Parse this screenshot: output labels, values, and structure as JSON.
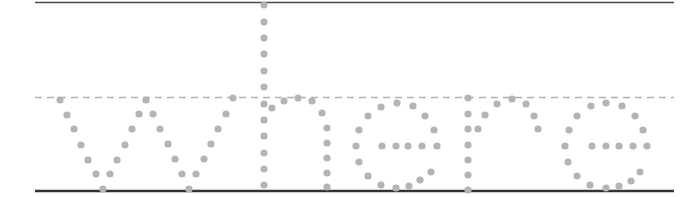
{
  "worksheet": {
    "word": "where",
    "letters": [
      "w",
      "h",
      "e",
      "r",
      "e"
    ],
    "style": "dotted tracing letters",
    "colors": {
      "dots": "#b4b4b4",
      "top_line": "#4a4a4a",
      "mid_line": "#b0b0b0",
      "base_line": "#333333",
      "background": "#ffffff"
    },
    "guides": {
      "x_start": 35,
      "x_end": 674,
      "top_y": 2.5,
      "mid_y": 97.5,
      "base_y": 191
    },
    "dot_radius": 3.6,
    "glyph_dots": {
      "w": [
        [
          60,
          100
        ],
        [
          67,
          115
        ],
        [
          74,
          129
        ],
        [
          81,
          145
        ],
        [
          88,
          160
        ],
        [
          96,
          174
        ],
        [
          103,
          189
        ],
        [
          110,
          174
        ],
        [
          117,
          160
        ],
        [
          125,
          145
        ],
        [
          132,
          129
        ],
        [
          139,
          114
        ],
        [
          146,
          100
        ],
        [
          153,
          114
        ],
        [
          160,
          129
        ],
        [
          168,
          144
        ],
        [
          175,
          159
        ],
        [
          182,
          174
        ],
        [
          189,
          189
        ],
        [
          196,
          174
        ],
        [
          204,
          159
        ],
        [
          211,
          144
        ],
        [
          218,
          129
        ],
        [
          226,
          114
        ],
        [
          233,
          98
        ]
      ],
      "h": [
        [
          264,
          5
        ],
        [
          264,
          22
        ],
        [
          264,
          38
        ],
        [
          264,
          54
        ],
        [
          264,
          71
        ],
        [
          264,
          87
        ],
        [
          264,
          104
        ],
        [
          264,
          120
        ],
        [
          264,
          136
        ],
        [
          264,
          153
        ],
        [
          264,
          169
        ],
        [
          264,
          185
        ],
        [
          272,
          108
        ],
        [
          284,
          101
        ],
        [
          298,
          98
        ],
        [
          312,
          101
        ],
        [
          322,
          113
        ],
        [
          327,
          128
        ],
        [
          327,
          143
        ],
        [
          327,
          158
        ],
        [
          327,
          173
        ],
        [
          327,
          187
        ]
      ],
      "e1": [
        [
          381,
          107
        ],
        [
          397,
          103
        ],
        [
          413,
          106
        ],
        [
          425,
          116
        ],
        [
          434,
          130
        ],
        [
          437,
          146
        ],
        [
          422,
          146
        ],
        [
          408,
          146
        ],
        [
          396,
          146
        ],
        [
          382,
          146
        ],
        [
          356,
          146
        ],
        [
          359,
          130
        ],
        [
          368,
          116
        ],
        [
          359,
          162
        ],
        [
          368,
          176
        ],
        [
          381,
          185
        ],
        [
          396,
          188
        ],
        [
          409,
          186
        ],
        [
          420,
          180
        ],
        [
          431,
          172
        ]
      ],
      "r": [
        [
          468,
          98
        ],
        [
          468,
          114
        ],
        [
          468,
          129
        ],
        [
          468,
          145
        ],
        [
          468,
          160
        ],
        [
          468,
          175
        ],
        [
          468,
          190
        ],
        [
          478,
          129
        ],
        [
          485,
          115
        ],
        [
          497,
          104
        ],
        [
          512,
          99
        ],
        [
          526,
          104
        ],
        [
          534,
          116
        ],
        [
          538,
          129
        ]
      ],
      "e2": [
        [
          577,
          116
        ],
        [
          591,
          106
        ],
        [
          606,
          103
        ],
        [
          622,
          106
        ],
        [
          635,
          116
        ],
        [
          643,
          130
        ],
        [
          647,
          146
        ],
        [
          633,
          146
        ],
        [
          619,
          146
        ],
        [
          606,
          146
        ],
        [
          592,
          146
        ],
        [
          565,
          146
        ],
        [
          569,
          130
        ],
        [
          568,
          162
        ],
        [
          577,
          176
        ],
        [
          590,
          185
        ],
        [
          606,
          188
        ],
        [
          619,
          186
        ],
        [
          631,
          181
        ],
        [
          640,
          172
        ]
      ]
    }
  }
}
